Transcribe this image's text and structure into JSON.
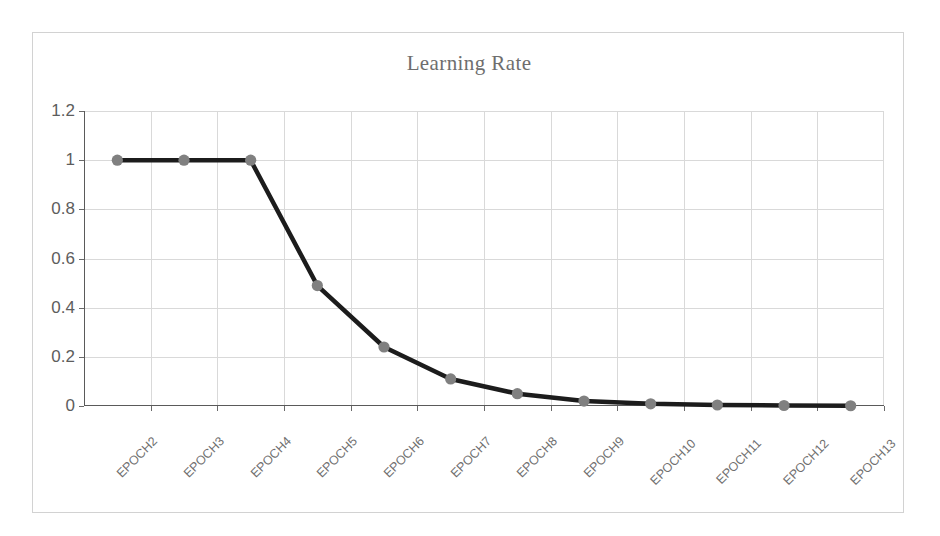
{
  "chart_data": {
    "type": "line",
    "title": "Learning Rate",
    "xlabel": "",
    "ylabel": "",
    "categories": [
      "EPOCH2",
      "EPOCH3",
      "EPOCH4",
      "EPOCH5",
      "EPOCH6",
      "EPOCH7",
      "EPOCH8",
      "EPOCH9",
      "EPOCH10",
      "EPOCH11",
      "EPOCH12",
      "EPOCH13"
    ],
    "values": [
      1,
      1,
      1,
      0.49,
      0.24,
      0.11,
      0.05,
      0.02,
      0.009,
      0.004,
      0.002,
      0.001
    ],
    "series": [
      {
        "name": "Learning Rate",
        "values": [
          1,
          1,
          1,
          0.49,
          0.24,
          0.11,
          0.05,
          0.02,
          0.009,
          0.004,
          0.002,
          0.001
        ]
      }
    ],
    "ylim": [
      0,
      1.2
    ],
    "y_ticks": [
      0,
      0.2,
      0.4,
      0.6,
      0.8,
      1,
      1.2
    ],
    "y_tick_labels": [
      "0",
      "0.2",
      "0.4",
      "0.6",
      "0.8",
      "1",
      "1.2"
    ],
    "grid": true,
    "grid_axis": "both",
    "legend": false,
    "legend_position": "none",
    "marker": "circle",
    "colors": {
      "line": "#1c1c1c",
      "marker": "#808080",
      "grid": "#d9d9d9",
      "axis": "#5a5a5a",
      "title_text": "#6e6e6e",
      "tick_text": "#5d5d5d",
      "category_text": "#6f6f6f",
      "frame": "#d2d2d2",
      "background": "#ffffff"
    }
  }
}
